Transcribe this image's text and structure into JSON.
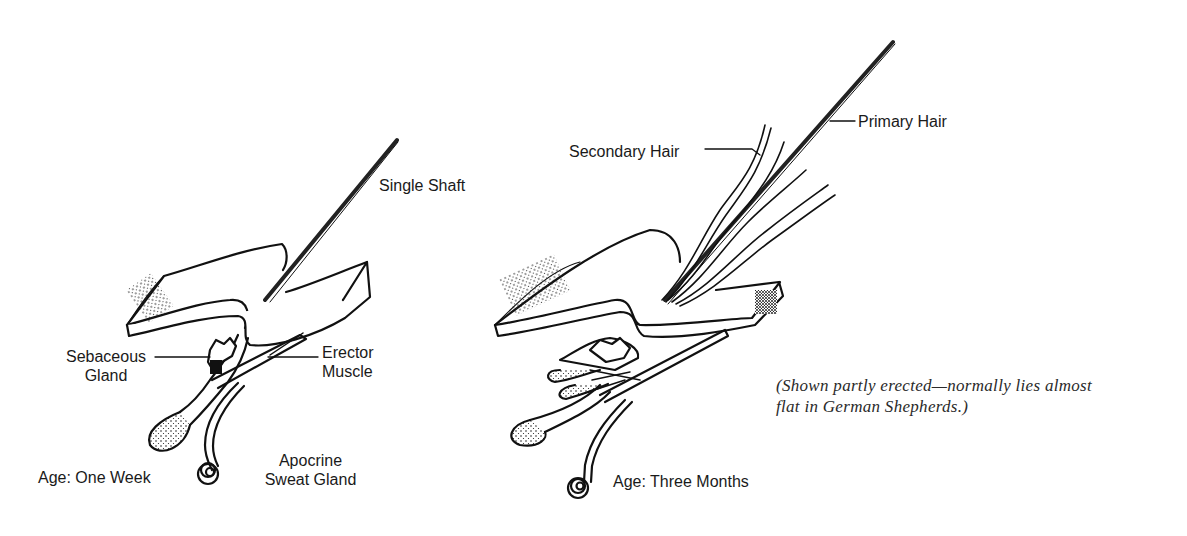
{
  "diagram": {
    "left_panel": {
      "age_label": "Age: One Week",
      "labels": {
        "shaft": "Single Shaft",
        "sebaceous_line1": "Sebaceous",
        "sebaceous_line2": "Gland",
        "erector_line1": "Erector",
        "erector_line2": "Muscle",
        "apocrine_line1": "Apocrine",
        "apocrine_line2": "Sweat Gland"
      }
    },
    "right_panel": {
      "age_label": "Age: Three Months",
      "labels": {
        "primary": "Primary Hair",
        "secondary": "Secondary Hair"
      }
    },
    "caption": {
      "line1": "(Shown partly erected—normally lies almost",
      "line2": "flat in German Shepherds.)"
    },
    "colors": {
      "ink": "#1a1a1a",
      "background": "#ffffff"
    }
  }
}
